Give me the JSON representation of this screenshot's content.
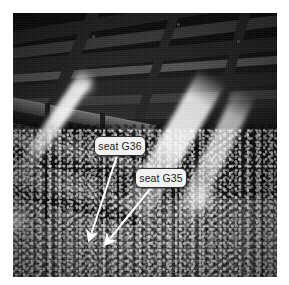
{
  "canvas": {
    "width": 289,
    "height": 285,
    "background_color": "#ffffff"
  },
  "photo": {
    "description": "Black and white photograph of a large concert hall or auditorium interior, viewed from an upper balcony looking down across a dense seated audience toward bright diagonal spotlight beams.",
    "rendering": "grayscale",
    "frame": {
      "x": 13,
      "y": 13,
      "width": 264,
      "height": 264
    },
    "regions": [
      {
        "name": "ceiling",
        "description": "dark angular coffered ceiling beams across the top"
      },
      {
        "name": "balcony-tiers",
        "description": "diagonal balcony tiers stepping down on the left side"
      },
      {
        "name": "stage-wall",
        "description": "dark far wall in the upper right"
      },
      {
        "name": "audience",
        "description": "dense crowd of seated people filling the lower two thirds"
      },
      {
        "name": "spotlight-beams",
        "description": "bright diagonal light beams sweeping from upper right down to the left"
      }
    ]
  },
  "annotations": {
    "line_color": "#ffffff",
    "label_background_color": "#f2f2f2",
    "label_border_color": "#2e2e2e",
    "label_text_color": "#1a1a1a",
    "callouts": [
      {
        "id": "g36",
        "label": "seat G36",
        "box": {
          "x": 94,
          "y": 136,
          "width": 52,
          "height": 20
        },
        "leader": {
          "x1": 117,
          "y1": 156,
          "x2": 90,
          "y2": 236
        },
        "arrow_tip": {
          "x": 90,
          "y": 236
        }
      },
      {
        "id": "g35",
        "label": "seat G35",
        "box": {
          "x": 135,
          "y": 168,
          "width": 52,
          "height": 20
        },
        "leader": {
          "x1": 151,
          "y1": 188,
          "x2": 108,
          "y2": 241
        },
        "arrow_tip": {
          "x": 108,
          "y": 241
        }
      }
    ]
  }
}
